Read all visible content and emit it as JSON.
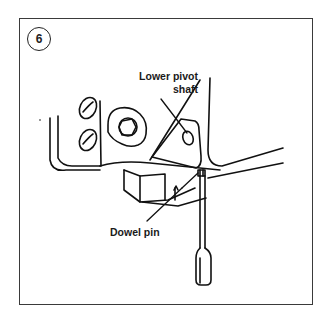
{
  "figure": {
    "step_number": "6",
    "callouts": {
      "lower_pivot_shaft_line1": "Lower pivot",
      "lower_pivot_shaft_line2": "shaft",
      "dowel_pin": "Dowel pin"
    },
    "parts": [
      "frame-panel",
      "screw-heads",
      "adjustment-knob",
      "pivot-bracket",
      "lower-pivot-shaft",
      "dowel-pin",
      "base-block",
      "screwdriver"
    ],
    "colors": {
      "line": "#111111",
      "frame": "#3a3a3a",
      "background": "#ffffff"
    }
  }
}
